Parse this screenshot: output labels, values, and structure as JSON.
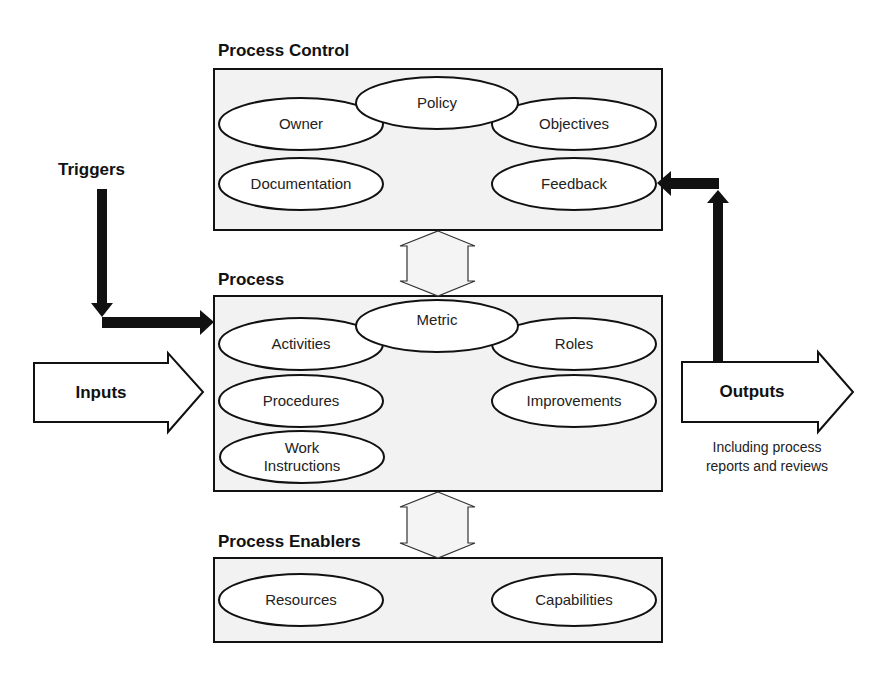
{
  "sections": {
    "control": {
      "title": "Process Control",
      "items": [
        "Policy",
        "Owner",
        "Objectives",
        "Documentation",
        "Feedback"
      ]
    },
    "process": {
      "title": "Process",
      "items": [
        "Metric",
        "Activities",
        "Roles",
        "Procedures",
        "Improvements",
        "Work",
        "Instructions"
      ]
    },
    "enablers": {
      "title": "Process Enablers",
      "items": [
        "Resources",
        "Capabilities"
      ]
    }
  },
  "flows": {
    "triggers": "Triggers",
    "inputs": "Inputs",
    "outputs": "Outputs",
    "outputs_note_line1": "Including process",
    "outputs_note_line2": "reports and reviews"
  },
  "colors": {
    "box_fill": "#f2f2f2",
    "stroke": "#111111",
    "ellipse_fill": "#ffffff"
  }
}
